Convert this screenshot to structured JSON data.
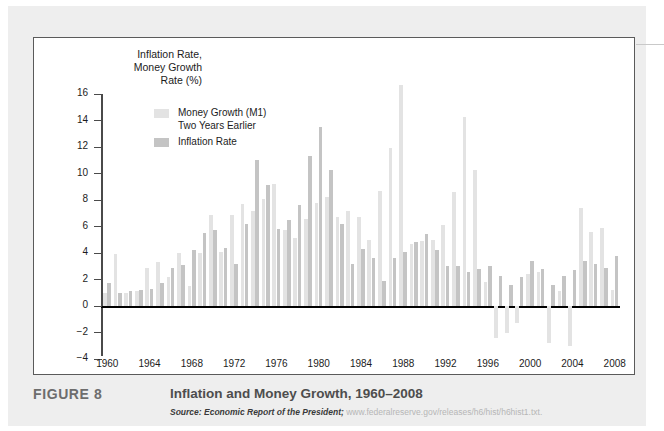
{
  "axis_title": "Inflation Rate,\nMoney Growth\nRate (%)",
  "legend": {
    "items": [
      {
        "label": "Money Growth (M1)\nTwo Years Earlier",
        "color": "#e3e3e3"
      },
      {
        "label": "Inflation Rate",
        "color": "#c4c4c4"
      }
    ]
  },
  "caption": {
    "figure_number": "FIGURE 8",
    "title": "Inflation and Money Growth, 1960–2008",
    "source_prefix": "Source: Economic Report of the President;",
    "source_url": "www.federalreserve.gov/releases/h6/hist/h6hist1.txt."
  },
  "chart_data": {
    "type": "bar",
    "title": "Inflation and Money Growth, 1960–2008",
    "xlabel": "",
    "ylabel": "Inflation Rate, Money Growth Rate (%)",
    "ylim": [
      -4,
      16
    ],
    "yticks": [
      -4,
      -2,
      0,
      2,
      4,
      6,
      8,
      10,
      12,
      14,
      16
    ],
    "ytick_labels": [
      "−4",
      "−2",
      "0",
      "2",
      "4",
      "6",
      "8",
      "10",
      "12",
      "14",
      "16"
    ],
    "xticks": [
      1960,
      1964,
      1968,
      1972,
      1976,
      1980,
      1984,
      1988,
      1992,
      1996,
      2000,
      2004,
      2008
    ],
    "xlim": [
      1959.5,
      2009.5
    ],
    "grid": false,
    "legend_position": "upper-left-inside",
    "categories": [
      1960,
      1961,
      1962,
      1963,
      1964,
      1965,
      1966,
      1967,
      1968,
      1969,
      1970,
      1971,
      1972,
      1973,
      1974,
      1975,
      1976,
      1977,
      1978,
      1979,
      1980,
      1981,
      1982,
      1983,
      1984,
      1985,
      1986,
      1987,
      1988,
      1989,
      1990,
      1991,
      1992,
      1993,
      1994,
      1995,
      1996,
      1997,
      1998,
      1999,
      2000,
      2001,
      2002,
      2003,
      2004,
      2005,
      2006,
      2007,
      2008
    ],
    "series": [
      {
        "name": "Money Growth (M1) Two Years Earlier",
        "color": "#e3e3e3",
        "values": [
          1.0,
          3.9,
          1.0,
          1.1,
          2.9,
          3.3,
          2.2,
          4.0,
          1.5,
          4.0,
          6.9,
          4.1,
          6.9,
          7.7,
          7.2,
          8.1,
          9.2,
          5.7,
          5.1,
          6.6,
          7.8,
          8.2,
          6.7,
          7.2,
          6.7,
          5.0,
          8.7,
          11.9,
          16.7,
          4.7,
          4.9,
          5.0,
          6.1,
          8.6,
          14.3,
          10.3,
          1.8,
          -2.4,
          -2.0,
          -1.3,
          2.4,
          2.6,
          -2.8,
          1.1,
          -3.0,
          7.4,
          5.6,
          5.9,
          1.2
        ]
      },
      {
        "name": "Inflation Rate",
        "color": "#c4c4c4",
        "values": [
          1.7,
          1.0,
          1.1,
          1.2,
          1.3,
          1.7,
          2.9,
          3.1,
          4.2,
          5.5,
          5.7,
          4.4,
          3.2,
          6.2,
          11.0,
          9.1,
          5.8,
          6.5,
          7.6,
          11.3,
          13.5,
          10.3,
          6.2,
          3.2,
          4.3,
          3.6,
          1.9,
          3.6,
          4.1,
          4.8,
          5.4,
          4.2,
          3.0,
          3.0,
          2.6,
          2.8,
          3.0,
          2.3,
          1.6,
          2.2,
          3.4,
          2.8,
          1.6,
          2.3,
          2.7,
          3.4,
          3.2,
          2.9,
          3.8
        ]
      }
    ]
  }
}
